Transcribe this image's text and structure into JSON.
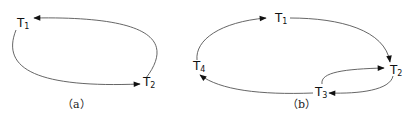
{
  "panels": [
    {
      "id": "a",
      "caption": "（a）",
      "nodes": [
        {
          "id": "T1",
          "base": "T",
          "sub": "1"
        },
        {
          "id": "T2",
          "base": "T",
          "sub": "2"
        }
      ],
      "edges": [
        {
          "from": "T2",
          "to": "T1",
          "route": "upper-right"
        },
        {
          "from": "T1",
          "to": "T2",
          "route": "lower-left"
        }
      ]
    },
    {
      "id": "b",
      "caption": "（b）",
      "nodes": [
        {
          "id": "T1",
          "base": "T",
          "sub": "1"
        },
        {
          "id": "T2",
          "base": "T",
          "sub": "2"
        },
        {
          "id": "T3",
          "base": "T",
          "sub": "3"
        },
        {
          "id": "T4",
          "base": "T",
          "sub": "4"
        }
      ],
      "edges": [
        {
          "from": "T1",
          "to": "T2"
        },
        {
          "from": "T2",
          "to": "T3"
        },
        {
          "from": "T3",
          "to": "T2"
        },
        {
          "from": "T3",
          "to": "T4"
        },
        {
          "from": "T4",
          "to": "T1"
        }
      ]
    }
  ]
}
